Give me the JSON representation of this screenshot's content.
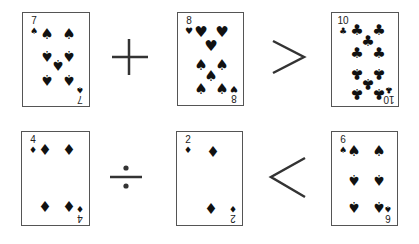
{
  "puzzle": {
    "rows": [
      {
        "left_card": {
          "rank": "7",
          "suit": "spades",
          "suit_glyph": "♠"
        },
        "operator": {
          "symbol": "+",
          "name": "plus"
        },
        "middle_card": {
          "rank": "8",
          "suit": "hearts/spades (mixed)",
          "suit_glyph": "♥"
        },
        "comparison": {
          "symbol": ">",
          "name": "greater-than"
        },
        "right_card": {
          "rank": "10",
          "suit": "clubs",
          "suit_glyph": "♣"
        }
      },
      {
        "left_card": {
          "rank": "4",
          "suit": "diamonds",
          "suit_glyph": "♦"
        },
        "operator": {
          "symbol": "÷",
          "name": "divide"
        },
        "middle_card": {
          "rank": "2",
          "suit": "diamonds",
          "suit_glyph": "♦"
        },
        "comparison": {
          "symbol": "<",
          "name": "less-than"
        },
        "right_card": {
          "rank": "6",
          "suit": "spades",
          "suit_glyph": "♠"
        }
      }
    ]
  },
  "cards": [
    {
      "rank": "7",
      "glyph": "♠",
      "idx_glyph": "♠",
      "x": 22,
      "y": 12,
      "w": 68,
      "h": 95,
      "pips": [
        [
          24,
          21,
          "♠",
          0
        ],
        [
          46,
          21,
          "♠",
          0
        ],
        [
          24,
          42,
          "♠",
          1
        ],
        [
          46,
          42,
          "♠",
          1
        ],
        [
          35,
          51,
          "♠",
          1
        ],
        [
          24,
          66,
          "♠",
          1
        ],
        [
          46,
          66,
          "♠",
          1
        ]
      ]
    },
    {
      "rank": "8",
      "glyph": "♥",
      "idx_glyph": "♥",
      "x": 177,
      "y": 12,
      "w": 67,
      "h": 94,
      "pips": [
        [
          23,
          19,
          "♥",
          0
        ],
        [
          44,
          19,
          "♥",
          0
        ],
        [
          33,
          33,
          "♥",
          0
        ],
        [
          23,
          52,
          "♠",
          0
        ],
        [
          44,
          52,
          "♠",
          0
        ],
        [
          33,
          63,
          "♠",
          0
        ],
        [
          23,
          76,
          "♠",
          0
        ],
        [
          44,
          76,
          "♠",
          0
        ]
      ]
    },
    {
      "rank": "10",
      "glyph": "♣",
      "idx_glyph": "♣",
      "x": 331,
      "y": 12,
      "w": 68,
      "h": 95,
      "pips": [
        [
          25,
          17,
          "♣",
          0
        ],
        [
          47,
          17,
          "♣",
          0
        ],
        [
          36,
          28,
          "♣",
          0
        ],
        [
          25,
          40,
          "♣",
          0
        ],
        [
          47,
          40,
          "♣",
          0
        ],
        [
          25,
          60,
          "♣",
          1
        ],
        [
          47,
          60,
          "♣",
          1
        ],
        [
          36,
          70,
          "♣",
          1
        ],
        [
          25,
          80,
          "♣",
          1
        ],
        [
          47,
          80,
          "♣",
          1
        ]
      ]
    },
    {
      "rank": "4",
      "glyph": "♦",
      "idx_glyph": "♦",
      "x": 21,
      "y": 131,
      "w": 69,
      "h": 95,
      "pips": [
        [
          23,
          18,
          "♦",
          0
        ],
        [
          47,
          18,
          "♦",
          0
        ],
        [
          23,
          75,
          "♦",
          0
        ],
        [
          47,
          75,
          "♦",
          0
        ]
      ]
    },
    {
      "rank": "2",
      "glyph": "♦",
      "idx_glyph": "♦",
      "x": 176,
      "y": 131,
      "w": 67,
      "h": 95,
      "pips": [
        [
          36,
          20,
          "♦",
          0
        ],
        [
          34,
          77,
          "♦",
          0
        ]
      ]
    },
    {
      "rank": "6",
      "glyph": "♠",
      "idx_glyph": "♠",
      "x": 331,
      "y": 131,
      "w": 67,
      "h": 95,
      "pips": [
        [
          22,
          19,
          "♠",
          0
        ],
        [
          47,
          19,
          "♠",
          0
        ],
        [
          22,
          47,
          "♠",
          1
        ],
        [
          47,
          47,
          "♠",
          1
        ],
        [
          22,
          74,
          "♠",
          1
        ],
        [
          47,
          74,
          "♠",
          1
        ]
      ]
    }
  ]
}
